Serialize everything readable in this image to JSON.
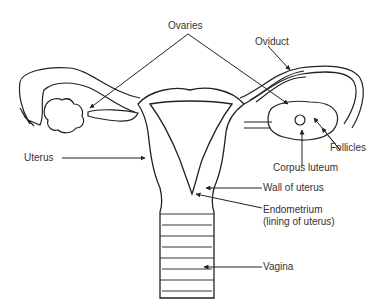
{
  "labels": {
    "ovaries": "Ovaries",
    "oviduct": "Oviduct",
    "follicles": "Follicles",
    "uterus": "Uterus",
    "corpus_luteum": "Corpus luteum",
    "wall_of_uterus": "Wall of uterus",
    "endometrium_line1": "Endometrium",
    "endometrium_line2": "(lining of uterus)",
    "vagina": "Vagina"
  },
  "colors": {
    "line": "#222222",
    "text": "#333333",
    "background": "#ffffff"
  }
}
